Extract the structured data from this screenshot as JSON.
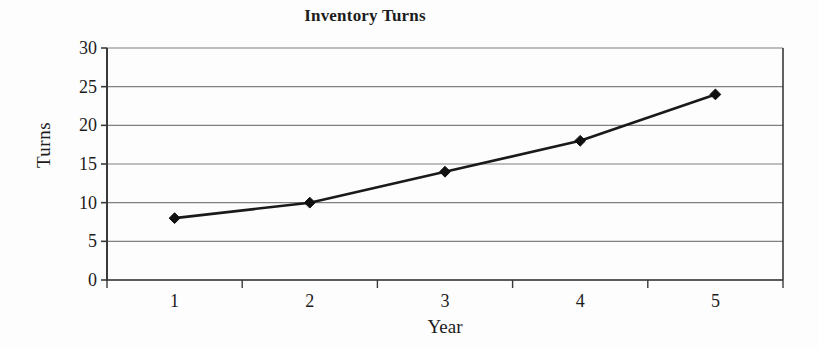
{
  "chart_data": {
    "type": "line",
    "title": "Inventory Turns",
    "xlabel": "Year",
    "ylabel": "Turns",
    "categories": [
      "1",
      "2",
      "3",
      "4",
      "5"
    ],
    "values": [
      8,
      10,
      14,
      18,
      24
    ],
    "series": [
      {
        "name": "Inventory Turns",
        "values": [
          8,
          10,
          14,
          18,
          24
        ]
      }
    ],
    "ylim": [
      0,
      30
    ],
    "ytick_labels": [
      "0",
      "5",
      "10",
      "15",
      "20",
      "25",
      "30"
    ],
    "ytick_values": [
      0,
      5,
      10,
      15,
      20,
      25,
      30
    ],
    "xtick_labels": [
      "1",
      "2",
      "3",
      "4",
      "5"
    ],
    "grid": "horizontal",
    "legend": "none",
    "marker": "diamond",
    "colors": {
      "line": "#1a1a1a",
      "marker": "#111111",
      "gridline": "#808080",
      "axis": "#3a3a3a",
      "text": "#1c1c1c",
      "background": "#fdfdfd"
    }
  }
}
